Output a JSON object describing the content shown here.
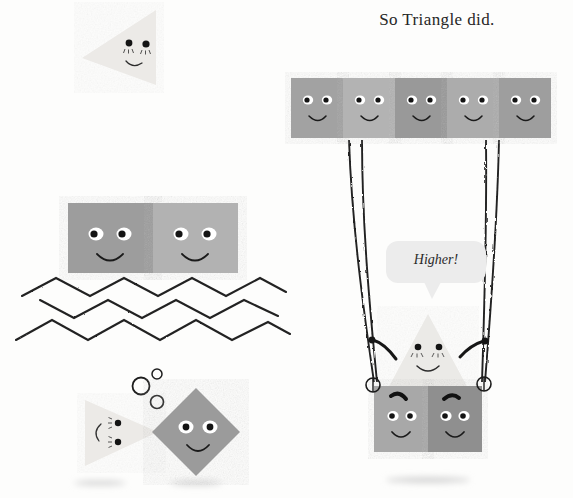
{
  "scene": {
    "title": "So Triangle did.",
    "background_color": "#fdfdfc",
    "illustration_name": "triangle-on-a-swing"
  },
  "caption": {
    "text": "So Triangle did."
  },
  "speech_bubble": {
    "text": "Higher!",
    "fill": "#ececec"
  },
  "palette": {
    "triangle_pale": "#ebeae7",
    "triangle_pale_2": "#e6e5e2",
    "square_light": "#b4b4b4",
    "square_mid": "#a0a0a0",
    "square_dark": "#8e8e8e",
    "square_darker": "#848484",
    "ink": "#1b1b1b",
    "rope": "#2a2a2a",
    "shadow": "#d8d8d8",
    "eye_white": "#ffffff"
  },
  "left_panel": {
    "flag_triangle": {
      "name": "flag-triangle-character",
      "expression": "smiling",
      "fill": "#ebeae7"
    },
    "pole": {
      "name": "flag-pole",
      "color": "#222222"
    },
    "raft_squares": [
      {
        "name": "raft-square-left",
        "fill": "#9d9d9d",
        "expression": "smiling"
      },
      {
        "name": "raft-square-right",
        "fill": "#b2b2b2",
        "expression": "smiling"
      }
    ],
    "water": {
      "name": "zigzag-water",
      "rows": 3,
      "color": "#232323"
    },
    "bubbles": [
      {
        "name": "bubble-small-top",
        "r": 5
      },
      {
        "name": "bubble-large",
        "r": 9
      },
      {
        "name": "bubble-medium",
        "r": 7
      }
    ],
    "underwater_triangle": {
      "name": "underwater-triangle-character",
      "fill": "#eceae7",
      "expression": "smiling-sideways"
    },
    "underwater_diamond": {
      "name": "underwater-diamond-character",
      "fill": "#9b9b9b",
      "expression": "smiling"
    },
    "shadows": [
      {
        "name": "shadow-under-triangle"
      },
      {
        "name": "shadow-under-diamond"
      }
    ]
  },
  "right_panel": {
    "top_bar_squares": [
      {
        "name": "beam-square-1",
        "fill": "#a2a2a2",
        "expression": "smiling"
      },
      {
        "name": "beam-square-2",
        "fill": "#b3b3b3",
        "expression": "smiling"
      },
      {
        "name": "beam-square-3",
        "fill": "#999999",
        "expression": "smiling"
      },
      {
        "name": "beam-square-4",
        "fill": "#acacac",
        "expression": "smiling"
      },
      {
        "name": "beam-square-5",
        "fill": "#9e9e9e",
        "expression": "smiling"
      }
    ],
    "ropes": {
      "name": "swing-ropes",
      "count": 4,
      "color": "#222222"
    },
    "rings": [
      {
        "name": "rope-ring-left"
      },
      {
        "name": "rope-ring-right"
      }
    ],
    "swing_triangle": {
      "name": "swing-triangle-character",
      "fill": "#eceae7",
      "expression": "smiling-arms-out"
    },
    "seat_squares": [
      {
        "name": "seat-square-left",
        "fill": "#a8a8a8",
        "expression": "straining-eyebrow"
      },
      {
        "name": "seat-square-right",
        "fill": "#8f8f8f",
        "expression": "straining-eyebrow"
      }
    ],
    "shadow": {
      "name": "shadow-under-swing"
    }
  }
}
